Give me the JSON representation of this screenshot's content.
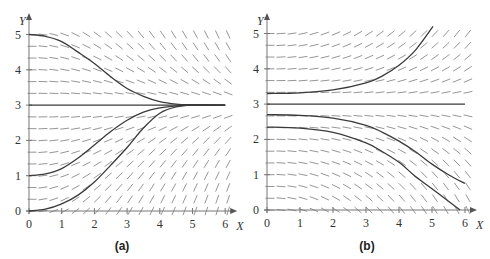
{
  "chart_data": [
    {
      "type": "line",
      "subtype": "slope-field",
      "caption": "(a)",
      "xlabel": "X",
      "ylabel": "Y",
      "xlim": [
        0,
        6
      ],
      "ylim": [
        0,
        5
      ],
      "xticks": [
        "0",
        "1",
        "2",
        "3",
        "4",
        "5",
        "6"
      ],
      "yticks": [
        "0",
        "1",
        "2",
        "3",
        "4",
        "5"
      ],
      "grid": false,
      "field": {
        "form": "k*x*(3-y)",
        "k": 0.17,
        "step": 0.3333
      },
      "equilibrium": 3,
      "series": [
        {
          "name": "y0=5",
          "points": [
            [
              0,
              5
            ],
            [
              0.5,
              4.95
            ],
            [
              1,
              4.8
            ],
            [
              1.5,
              4.5
            ],
            [
              2,
              4.18
            ],
            [
              2.5,
              3.8
            ],
            [
              3,
              3.47
            ],
            [
              3.5,
              3.25
            ],
            [
              4,
              3.1
            ],
            [
              4.5,
              3.03
            ],
            [
              5,
              3.01
            ],
            [
              6,
              3.0
            ]
          ]
        },
        {
          "name": "y0=3",
          "points": [
            [
              0,
              3
            ],
            [
              6,
              3
            ]
          ]
        },
        {
          "name": "y0=1",
          "points": [
            [
              0,
              1
            ],
            [
              0.5,
              1.05
            ],
            [
              1,
              1.2
            ],
            [
              1.5,
              1.5
            ],
            [
              2,
              1.87
            ],
            [
              2.5,
              2.25
            ],
            [
              3,
              2.57
            ],
            [
              3.5,
              2.8
            ],
            [
              4,
              2.92
            ],
            [
              4.5,
              2.98
            ],
            [
              5,
              3.0
            ],
            [
              6,
              3.0
            ]
          ]
        },
        {
          "name": "y0=0",
          "points": [
            [
              0,
              0
            ],
            [
              0.5,
              0.05
            ],
            [
              1,
              0.2
            ],
            [
              1.5,
              0.45
            ],
            [
              2,
              0.82
            ],
            [
              2.5,
              1.3
            ],
            [
              3,
              1.8
            ],
            [
              3.5,
              2.35
            ],
            [
              4,
              2.77
            ],
            [
              4.5,
              2.95
            ],
            [
              5,
              3.0
            ],
            [
              6,
              3.0
            ]
          ]
        }
      ]
    },
    {
      "type": "line",
      "subtype": "slope-field",
      "caption": "(b)",
      "xlabel": "X",
      "ylabel": "Y",
      "xlim": [
        0,
        6
      ],
      "ylim": [
        0,
        5
      ],
      "xticks": [
        "0",
        "1",
        "2",
        "3",
        "4",
        "5",
        "6"
      ],
      "yticks": [
        "0",
        "1",
        "2",
        "3",
        "4",
        "5"
      ],
      "grid": false,
      "field": {
        "form": "k*x*(y-3)",
        "k": 0.1,
        "step": 0.3333
      },
      "equilibrium": 3,
      "series": [
        {
          "name": "y0=3.3",
          "points": [
            [
              0,
              3.3
            ],
            [
              1,
              3.32
            ],
            [
              2,
              3.4
            ],
            [
              3,
              3.6
            ],
            [
              3.5,
              3.8
            ],
            [
              4,
              4.1
            ],
            [
              4.5,
              4.53
            ],
            [
              5.03,
              5.2
            ]
          ]
        },
        {
          "name": "y0=3",
          "points": [
            [
              0,
              3
            ],
            [
              6,
              3
            ]
          ]
        },
        {
          "name": "y0=2.7",
          "points": [
            [
              0,
              2.7
            ],
            [
              1,
              2.68
            ],
            [
              2,
              2.6
            ],
            [
              3,
              2.4
            ],
            [
              3.5,
              2.2
            ],
            [
              4,
              1.95
            ],
            [
              4.5,
              1.65
            ],
            [
              5,
              1.3
            ],
            [
              5.5,
              1.0
            ],
            [
              6,
              0.75
            ]
          ]
        },
        {
          "name": "y0=2.35",
          "points": [
            [
              0,
              2.35
            ],
            [
              1,
              2.32
            ],
            [
              2,
              2.2
            ],
            [
              3,
              1.9
            ],
            [
              3.5,
              1.65
            ],
            [
              4,
              1.35
            ],
            [
              4.5,
              0.95
            ],
            [
              5,
              0.6
            ],
            [
              5.5,
              0.25
            ],
            [
              5.85,
              0
            ]
          ]
        }
      ]
    }
  ]
}
